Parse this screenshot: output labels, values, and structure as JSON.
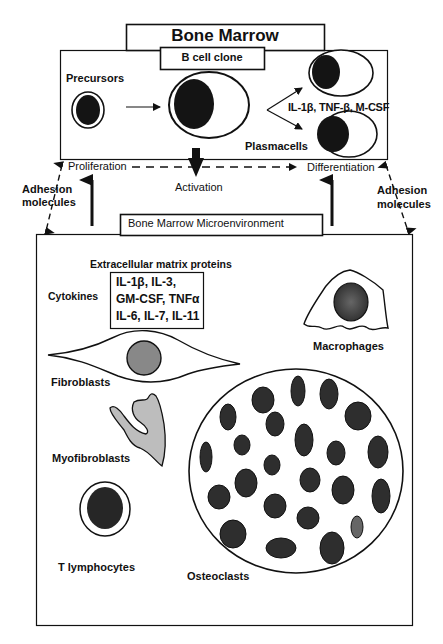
{
  "title": "Bone Marrow",
  "b_cell_section": {
    "header": "B cell clone",
    "precursors_label": "Precursors",
    "cytokines_label": "IL-1β, TNF-β, M-CSF",
    "plasmacells_label": "Plasmacells"
  },
  "processes": {
    "proliferation": "Proliferation",
    "activation": "Activation",
    "differentiation": "Differentiation"
  },
  "adhesion": {
    "left_line1": "Adhesion",
    "left_line2": "molecules",
    "right_line1": "Adhesion",
    "right_line2": "molecules"
  },
  "microenvironment": {
    "header": "Bone Marrow Microenvironment",
    "ecm_label": "Extracellular matrix proteins",
    "cytokines_label": "Cytokines",
    "cytokine_list": [
      "IL-1β, IL-3,",
      "GM-CSF, TNFα",
      "IL-6, IL-7, IL-11"
    ],
    "cells": {
      "macrophages": "Macrophages",
      "fibroblasts": "Fibroblasts",
      "myofibroblasts": "Myofibroblasts",
      "t_lymphocytes": "T lymphocytes",
      "osteoclasts": "Osteoclasts"
    }
  },
  "colors": {
    "stroke": "#111111",
    "nucleus_dark": "#1a1a1a",
    "nucleus_gray": "#555555",
    "fill_light_gray": "#bdbdbd"
  }
}
